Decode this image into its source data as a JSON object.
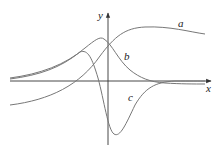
{
  "diagram": {
    "axes": {
      "x_label": "x",
      "y_label": "y"
    },
    "curves": [
      {
        "name": "a",
        "label": "a",
        "path": "M10,105 C50,100 80,85 100,56 C115,36 125,28 145,27 C170,26 190,32 205,34"
      },
      {
        "name": "b",
        "label": "b",
        "path": "M10,78 C40,74 65,65 85,48 C95,40 100,36 104,39 C112,44 118,60 130,70 C140,78 150,82 165,83 C180,84 195,84 205,84"
      },
      {
        "name": "c",
        "label": "c",
        "path": "M10,79 C40,75 60,68 80,52 C88,49 92,58 98,78 C104,100 108,130 114,134 C120,138 126,124 135,105 C145,88 155,82 175,81 C190,81 200,81 205,81"
      }
    ],
    "labels": [
      {
        "id": "a",
        "text": "a",
        "x": 178,
        "y": 27
      },
      {
        "id": "b",
        "text": "b",
        "x": 124,
        "y": 60
      },
      {
        "id": "c",
        "text": "c",
        "x": 128,
        "y": 101
      },
      {
        "id": "y",
        "text": "y",
        "x": 98,
        "y": 19
      },
      {
        "id": "x",
        "text": "x",
        "x": 206,
        "y": 92
      }
    ]
  }
}
